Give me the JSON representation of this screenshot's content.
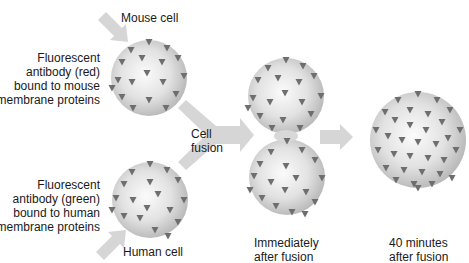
{
  "diagram": {
    "labels": {
      "mouse_cell": "Mouse cell",
      "mouse_antibody": [
        "Fluorescent",
        "antibody (red)",
        "bound to mouse",
        "membrane proteins"
      ],
      "human_antibody": [
        "Fluorescent",
        "antibody (green)",
        "bound to human",
        "membrane proteins"
      ],
      "human_cell": "Human cell",
      "cell_fusion": [
        "Cell",
        "fusion"
      ],
      "immediately_after": [
        "Immediately",
        "after fusion"
      ],
      "forty_minutes_after": [
        "40 minutes",
        "after fusion"
      ]
    },
    "nodes": [
      {
        "id": "mouse-cell",
        "cx": 149,
        "cy": 78,
        "r": 38
      },
      {
        "id": "human-cell",
        "cx": 150,
        "cy": 200,
        "r": 38
      },
      {
        "id": "fused-top",
        "cx": 286,
        "cy": 96,
        "r": 38
      },
      {
        "id": "fused-bottom",
        "cx": 287,
        "cy": 177,
        "r": 38
      },
      {
        "id": "fused-40min",
        "cx": 418,
        "cy": 140,
        "r": 48
      }
    ],
    "colors": {
      "sphere_light": "#f7f7f7",
      "sphere_dark": "#b8b8b8",
      "protein_marker": "#6e6e6e",
      "arrow": "#d6d6d6",
      "text": "#1a1a1a"
    }
  }
}
